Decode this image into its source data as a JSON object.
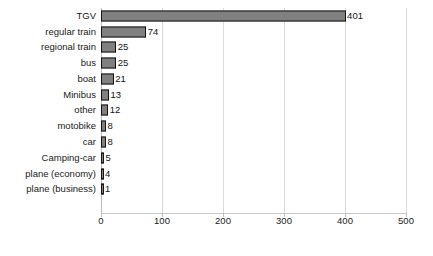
{
  "chart_data": {
    "type": "bar",
    "orientation": "horizontal",
    "title": "",
    "subtitle": "",
    "xlabel": "",
    "ylabel": "",
    "xlim": [
      0,
      500
    ],
    "xticks": [
      0,
      100,
      200,
      300,
      400,
      500
    ],
    "grid": true,
    "legend": false,
    "legend_position": "none",
    "categories": [
      "TGV",
      "regular train",
      "regional train",
      "bus",
      "boat",
      "Minibus",
      "other",
      "motobike",
      "car",
      "Camping-car",
      "plane (economy)",
      "plane  (business)"
    ],
    "values": [
      401,
      74,
      25,
      25,
      21,
      13,
      12,
      8,
      8,
      5,
      4,
      1
    ],
    "value_labels": [
      "401",
      "74",
      "25",
      "25",
      "21",
      "13",
      "12",
      "8",
      "8",
      "5",
      "4",
      "1"
    ],
    "colors": {
      "bar_fill": "#808080",
      "bar_outline": "#151515",
      "gridline": "#d9d9d9",
      "axis": "#c0c0c0",
      "text": "#1a1a1a",
      "background": "#ffffff"
    }
  }
}
